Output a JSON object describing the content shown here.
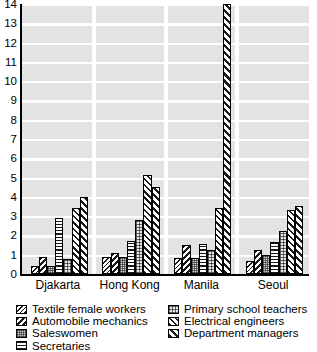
{
  "chart_data": {
    "type": "bar",
    "title": "",
    "subtitle": "",
    "xlabel": "",
    "ylabel": "",
    "ylim": [
      0,
      14
    ],
    "yticks": [
      0,
      1,
      2,
      3,
      4,
      5,
      6,
      7,
      8,
      9,
      10,
      11,
      12,
      13,
      14
    ],
    "ytick_labels": [
      "0",
      "1",
      "2",
      "3",
      "4",
      "5",
      "6",
      "7",
      "8",
      "9",
      "10",
      "11",
      "12",
      "13",
      "14"
    ],
    "grid": "horizontal-bands",
    "legend_position": "below-plot-two-columns",
    "categories": [
      "Djakarta",
      "Hong Kong",
      "Manila",
      "Seoul"
    ],
    "series": [
      {
        "name": "Textile female workers",
        "pattern": "diagonal-back-thin",
        "values": [
          0.4,
          0.9,
          0.85,
          0.65
        ]
      },
      {
        "name": "Automobile mechanics",
        "pattern": "diagonal-back-medium",
        "values": [
          0.9,
          1.1,
          1.5,
          1.25
        ]
      },
      {
        "name": "Saleswomen",
        "pattern": "gray-stipple",
        "values": [
          0.4,
          0.9,
          0.85,
          1.0
        ]
      },
      {
        "name": "Secretaries",
        "pattern": "horizontal-lines",
        "values": [
          2.9,
          1.7,
          1.55,
          1.65
        ]
      },
      {
        "name": "Primary school teachers",
        "pattern": "coarse-checker",
        "values": [
          0.8,
          2.8,
          1.25,
          2.25
        ]
      },
      {
        "name": "Electrical engineers",
        "pattern": "diagonal-forward-medium",
        "values": [
          3.4,
          5.15,
          3.4,
          3.3
        ]
      },
      {
        "name": "Department managers",
        "pattern": "diagonal-forward-bold",
        "values": [
          4.0,
          4.5,
          14.0,
          3.55
        ]
      }
    ]
  },
  "axis": {
    "y_tick_labels": [
      "14",
      "13",
      "12",
      "11",
      "10",
      "9",
      "8",
      "7",
      "6",
      "5",
      "4",
      "3",
      "2",
      "1",
      "0"
    ],
    "x_tick_labels": [
      "Djakarta",
      "Hong Kong",
      "Manila",
      "Seoul"
    ]
  },
  "legend": {
    "left_column": [
      "Textile female workers",
      "Automobile mechanics",
      "Saleswomen",
      "Secretaries"
    ],
    "right_column": [
      "Primary school teachers",
      "Electrical engineers",
      "Department managers"
    ]
  },
  "colors": {
    "ink": "#000000",
    "band": "#e3e3e3",
    "background": "#ffffff",
    "hatch": "#1a1a1a"
  }
}
